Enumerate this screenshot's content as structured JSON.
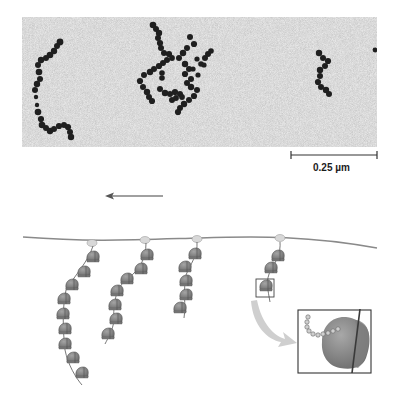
{
  "figure": {
    "micrograph": {
      "description": "Electron micrograph of polyribosomes",
      "background_color": "#b9b9b9",
      "ribosome_color": "#1e1e1e"
    },
    "scale_bar": {
      "label": "0.25 µm"
    },
    "direction_arrow": {
      "direction": "left",
      "color": "#7a7a7a"
    },
    "diagram": {
      "mrna_color": "#8a8a8a",
      "ribosome_color": "#808080",
      "chain_count": 4,
      "inset": {
        "description": "Ribosome on mRNA with growing polypeptide chain",
        "border_color": "#333333"
      },
      "zoom_arrow_color": "#cfcfcf"
    }
  }
}
